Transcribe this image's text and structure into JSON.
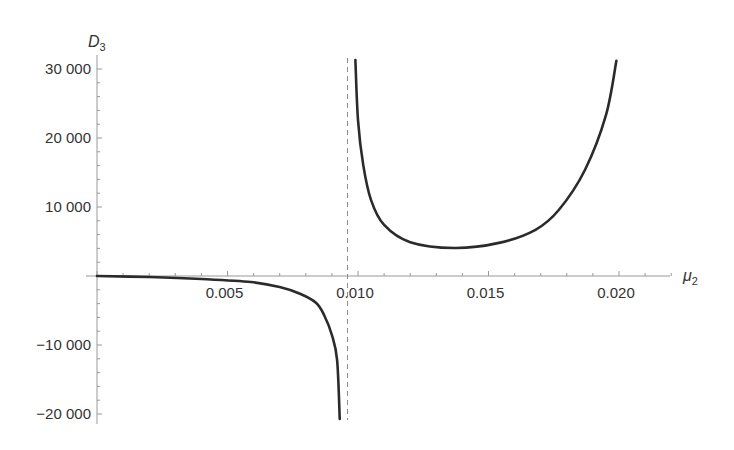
{
  "chart_data": {
    "type": "line",
    "title": "",
    "xlabel": "μ2",
    "ylabel": "D3",
    "xlabel_parts": {
      "base": "μ",
      "sub": "2"
    },
    "ylabel_parts": {
      "base": "D",
      "sub": "3"
    },
    "xlim": [
      0,
      0.0222
    ],
    "ylim": [
      -21000,
      32000
    ],
    "x_ticks": [
      {
        "value": 0.005,
        "label": "0.005"
      },
      {
        "value": 0.01,
        "label": "0.010"
      },
      {
        "value": 0.015,
        "label": "0.015"
      },
      {
        "value": 0.02,
        "label": "0.020"
      }
    ],
    "y_ticks": [
      {
        "value": 30000,
        "label": "30 000"
      },
      {
        "value": 20000,
        "label": "20 000"
      },
      {
        "value": 10000,
        "label": "10 000"
      },
      {
        "value": -10000,
        "label": "−10 000"
      },
      {
        "value": -20000,
        "label": "−20 000"
      }
    ],
    "grid": false,
    "legend": null,
    "annotations": [
      {
        "type": "vertical-asymptote",
        "style": "dashed",
        "x": 0.0096
      }
    ],
    "series": [
      {
        "name": "D3 (branch μ2 < asymptote)",
        "x": [
          0,
          0.002,
          0.004,
          0.0059,
          0.007,
          0.0078,
          0.0084,
          0.0087,
          0.009,
          0.0092,
          0.0093
        ],
        "y": [
          0,
          -150,
          -430,
          -870,
          -1600,
          -2600,
          -3900,
          -5650,
          -8550,
          -12200,
          -20700
        ]
      },
      {
        "name": "D3 (branch μ2 > asymptote)",
        "x": [
          0.0099,
          0.01,
          0.0102,
          0.0105,
          0.011,
          0.012,
          0.0137,
          0.0154,
          0.0168,
          0.0177,
          0.0187,
          0.0195,
          0.0199
        ],
        "y": [
          31300,
          22600,
          16100,
          11000,
          7400,
          4900,
          4060,
          4800,
          6700,
          9600,
          15400,
          23300,
          31200
        ]
      }
    ],
    "colors": {
      "curve": "#2b2b2b",
      "axis": "#999999",
      "text": "#333333"
    }
  }
}
